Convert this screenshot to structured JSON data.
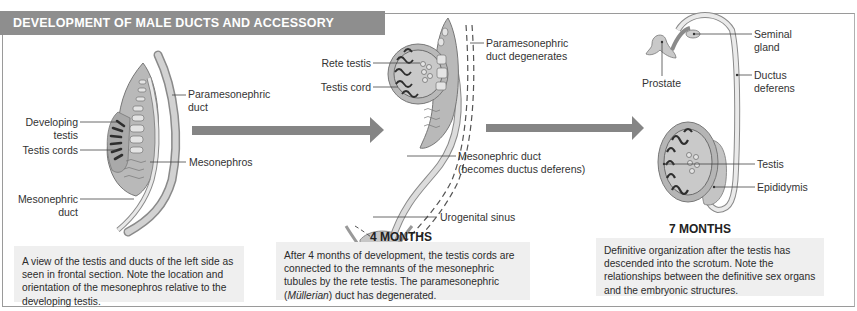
{
  "title": "DEVELOPMENT OF MALE DUCTS AND ACCESSORY ORGANS",
  "colors": {
    "banner": "#8e8e8e",
    "arrow": "#858585",
    "tissue_fill": "#b9b9b9",
    "tissue_light": "#dcdcdc",
    "cord_dark": "#2e2e2e",
    "caption_bg": "#efefef"
  },
  "panels": [
    {
      "stage_label": "",
      "labels": {
        "paramesonephric_duct_1": "Paramesonephric",
        "paramesonephric_duct_2": "duct",
        "developing_testis_1": "Developing",
        "developing_testis_2": "testis",
        "testis_cords": "Testis cords",
        "mesonephros": "Mesonephros",
        "mesonephric_duct_1": "Mesonephric",
        "mesonephric_duct_2": "duct"
      },
      "caption": "A view of the testis and ducts of the left side as seen in frontal section. Note the location and orientation of the mesonephros relative to the developing testis."
    },
    {
      "stage_label": "4 MONTHS",
      "labels": {
        "rete_testis": "Rete testis",
        "testis_cord": "Testis cord",
        "paramesonephric_degenerates_1": "Paramesonephric",
        "paramesonephric_degenerates_2": "duct degenerates",
        "mesonephric_duct_1": "Mesonephric duct",
        "mesonephric_duct_2": "(becomes ductus deferens)",
        "urogenital_sinus": "Urogenital sinus"
      },
      "caption_before": "After 4 months of development, the testis cords are connected to the remnants of the mesonephric tubules by the rete testis. The paramesonephric (",
      "caption_italic": "Müllerian",
      "caption_after": ") duct has degenerated."
    },
    {
      "stage_label": "7 MONTHS",
      "labels": {
        "seminal_gland_1": "Seminal",
        "seminal_gland_2": "gland",
        "prostate": "Prostate",
        "ductus_deferens_1": "Ductus",
        "ductus_deferens_2": "deferens",
        "testis": "Testis",
        "epididymis": "Epididymis"
      },
      "caption": "Definitive organization after the testis has descended into the scrotum. Note the relationships between the definitive sex organs and the embryonic structures."
    }
  ]
}
